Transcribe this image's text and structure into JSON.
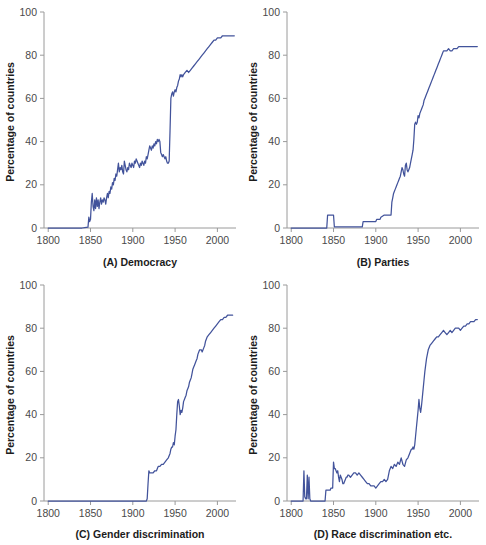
{
  "figure": {
    "axis_color": "#9a9a9a",
    "series_color": "#42539b",
    "text_color": "#1c1c1c",
    "tick_text_color": "#4a4a4a",
    "shared_ylabel": "Percentage of countries",
    "xticks": [
      1800,
      1850,
      1900,
      1950,
      2000
    ],
    "xtick_labels": [
      "1800",
      "1850",
      "1900",
      "1950",
      "2000"
    ],
    "yticks": [
      0,
      20,
      40,
      60,
      80,
      100
    ],
    "ytick_labels": [
      "0",
      "20",
      "40",
      "60",
      "80",
      "100"
    ],
    "xlim": [
      1795,
      2022
    ],
    "ylim": [
      0,
      100
    ]
  },
  "chart_data": [
    {
      "type": "line",
      "panel": "A",
      "title": "(A) Democracy",
      "xlabel": "",
      "ylabel": "Percentage of countries",
      "xlim": [
        1795,
        2022
      ],
      "ylim": [
        0,
        100
      ],
      "xticks": [
        1800,
        1850,
        1900,
        1950,
        2000
      ],
      "yticks": [
        0,
        20,
        40,
        60,
        80,
        100
      ],
      "grid": false,
      "legend": "none",
      "series": [
        {
          "name": "Democracy",
          "color": "#42539b",
          "x": [
            1800,
            1810,
            1820,
            1830,
            1840,
            1845,
            1847,
            1848,
            1849,
            1850,
            1851,
            1852,
            1853,
            1854,
            1855,
            1856,
            1857,
            1858,
            1859,
            1860,
            1861,
            1862,
            1863,
            1864,
            1865,
            1866,
            1867,
            1868,
            1869,
            1870,
            1871,
            1872,
            1873,
            1874,
            1875,
            1876,
            1877,
            1878,
            1879,
            1880,
            1881,
            1882,
            1883,
            1884,
            1885,
            1886,
            1887,
            1888,
            1889,
            1890,
            1891,
            1892,
            1893,
            1894,
            1895,
            1896,
            1897,
            1898,
            1899,
            1900,
            1901,
            1902,
            1903,
            1904,
            1905,
            1906,
            1907,
            1908,
            1909,
            1910,
            1911,
            1912,
            1913,
            1914,
            1915,
            1916,
            1917,
            1918,
            1919,
            1920,
            1921,
            1922,
            1923,
            1924,
            1925,
            1926,
            1927,
            1928,
            1929,
            1930,
            1931,
            1932,
            1933,
            1934,
            1935,
            1936,
            1937,
            1938,
            1939,
            1940,
            1941,
            1942,
            1943,
            1944,
            1945,
            1946,
            1947,
            1948,
            1949,
            1950,
            1951,
            1952,
            1953,
            1954,
            1955,
            1956,
            1957,
            1958,
            1959,
            1960,
            1962,
            1964,
            1966,
            1968,
            1970,
            1972,
            1974,
            1976,
            1978,
            1980,
            1982,
            1984,
            1986,
            1988,
            1990,
            1992,
            1994,
            1996,
            1998,
            2000,
            2002,
            2004,
            2006,
            2008,
            2010,
            2012,
            2014,
            2016,
            2018,
            2020
          ],
          "y": [
            0,
            0,
            0,
            0,
            0,
            0.3,
            0.4,
            5,
            3,
            4,
            12,
            16,
            10,
            8,
            13,
            9,
            14,
            10,
            13,
            9,
            12,
            14,
            11,
            13,
            12,
            14,
            13,
            11,
            14,
            16,
            14,
            17,
            16,
            19,
            18,
            21,
            20,
            23,
            22,
            25,
            24,
            27,
            30,
            26,
            28,
            27,
            29,
            26,
            25,
            31,
            29,
            27,
            26,
            28,
            27,
            30,
            29,
            28,
            30,
            29,
            28,
            31,
            30,
            32,
            31,
            30,
            29,
            28,
            30,
            29,
            31,
            30,
            29,
            31,
            30,
            33,
            32,
            34,
            36,
            38,
            37,
            36,
            38,
            37,
            39,
            38,
            40,
            39,
            41,
            40,
            41,
            40,
            35,
            34,
            33,
            34,
            33,
            32,
            33,
            31,
            30,
            30,
            31,
            45,
            60,
            62,
            63,
            61,
            63,
            64,
            63,
            65,
            66,
            68,
            69,
            71,
            70,
            71,
            70,
            71,
            72,
            73,
            72,
            73,
            74,
            75,
            76,
            77,
            78,
            79,
            80,
            81,
            82,
            83,
            84,
            85,
            86,
            87,
            87,
            88,
            88,
            88,
            89,
            89,
            89,
            89,
            89,
            89,
            89,
            89
          ]
        }
      ]
    },
    {
      "type": "line",
      "panel": "B",
      "title": "(B) Parties",
      "xlabel": "",
      "ylabel": "Percentage of countries",
      "xlim": [
        1795,
        2022
      ],
      "ylim": [
        0,
        100
      ],
      "xticks": [
        1800,
        1850,
        1900,
        1950,
        2000
      ],
      "yticks": [
        0,
        20,
        40,
        60,
        80,
        100
      ],
      "grid": false,
      "legend": "none",
      "series": [
        {
          "name": "Parties",
          "color": "#42539b",
          "x": [
            1800,
            1820,
            1835,
            1842,
            1843,
            1844,
            1848,
            1849,
            1850,
            1851,
            1852,
            1860,
            1870,
            1880,
            1884,
            1885,
            1890,
            1894,
            1895,
            1900,
            1901,
            1905,
            1906,
            1910,
            1911,
            1913,
            1914,
            1918,
            1919,
            1920,
            1921,
            1922,
            1923,
            1924,
            1925,
            1926,
            1927,
            1928,
            1929,
            1930,
            1931,
            1932,
            1933,
            1934,
            1935,
            1936,
            1937,
            1938,
            1939,
            1940,
            1941,
            1942,
            1943,
            1944,
            1945,
            1946,
            1947,
            1948,
            1949,
            1950,
            1951,
            1952,
            1953,
            1954,
            1955,
            1956,
            1957,
            1958,
            1959,
            1960,
            1961,
            1962,
            1963,
            1964,
            1965,
            1966,
            1967,
            1968,
            1969,
            1970,
            1971,
            1972,
            1973,
            1974,
            1975,
            1976,
            1977,
            1978,
            1979,
            1980,
            1982,
            1984,
            1986,
            1988,
            1990,
            1992,
            1994,
            1996,
            1998,
            2000,
            2005,
            2010,
            2015,
            2020
          ],
          "y": [
            0,
            0,
            0,
            0,
            6,
            6,
            6,
            6,
            6,
            0.5,
            0.5,
            0.5,
            0.5,
            0.5,
            0.5,
            3,
            3,
            3,
            3,
            3,
            4,
            4,
            5,
            6,
            6,
            6,
            6,
            6,
            12,
            14,
            16,
            17,
            18,
            19,
            20,
            21,
            22,
            23,
            24,
            26,
            28,
            27,
            25,
            24,
            29,
            30,
            27,
            26,
            27,
            28,
            30,
            32,
            34,
            36,
            41,
            48,
            49,
            48,
            49,
            52,
            51,
            53,
            54,
            55,
            56,
            57,
            59,
            60,
            61,
            62,
            63,
            64,
            65,
            66,
            67,
            68,
            69,
            70,
            71,
            72,
            73,
            74,
            75,
            76,
            77,
            78,
            79,
            80,
            81,
            82,
            82,
            82,
            83,
            82,
            82,
            83,
            83,
            83,
            84,
            84,
            84,
            84,
            84,
            84
          ]
        }
      ]
    },
    {
      "type": "line",
      "panel": "C",
      "title": "(C) Gender discrimination",
      "xlabel": "",
      "ylabel": "Percentage of countries",
      "xlim": [
        1795,
        2022
      ],
      "ylim": [
        0,
        100
      ],
      "xticks": [
        1800,
        1850,
        1900,
        1950,
        2000
      ],
      "yticks": [
        0,
        20,
        40,
        60,
        80,
        100
      ],
      "grid": false,
      "legend": "none",
      "series": [
        {
          "name": "Gender discrimination",
          "color": "#42539b",
          "x": [
            1800,
            1850,
            1900,
            1910,
            1915,
            1916,
            1917,
            1918,
            1919,
            1920,
            1922,
            1924,
            1926,
            1928,
            1930,
            1932,
            1934,
            1936,
            1938,
            1940,
            1942,
            1944,
            1945,
            1946,
            1947,
            1948,
            1949,
            1950,
            1951,
            1952,
            1953,
            1954,
            1955,
            1956,
            1957,
            1958,
            1959,
            1960,
            1961,
            1962,
            1963,
            1964,
            1965,
            1966,
            1967,
            1968,
            1969,
            1970,
            1971,
            1972,
            1973,
            1974,
            1975,
            1976,
            1977,
            1978,
            1979,
            1980,
            1981,
            1982,
            1983,
            1984,
            1985,
            1986,
            1988,
            1990,
            1992,
            1994,
            1996,
            1998,
            2000,
            2002,
            2004,
            2006,
            2008,
            2010,
            2012,
            2014,
            2016,
            2018
          ],
          "y": [
            0,
            0,
            0,
            0,
            0,
            0,
            1,
            8,
            14,
            13,
            13,
            13,
            14,
            14,
            16,
            16,
            17,
            17,
            18,
            19,
            20,
            22,
            24,
            25,
            25,
            27,
            26,
            30,
            33,
            40,
            46,
            47,
            44,
            40,
            42,
            41,
            43,
            46,
            47,
            48,
            49,
            51,
            52,
            53,
            55,
            56,
            57,
            59,
            61,
            62,
            63,
            64,
            65,
            66,
            68,
            69,
            70,
            70,
            70,
            69,
            70,
            71,
            72,
            74,
            76,
            77,
            78,
            79,
            80,
            81,
            82,
            83,
            84,
            84,
            85,
            85,
            86,
            86,
            86,
            86
          ]
        }
      ]
    },
    {
      "type": "line",
      "panel": "D",
      "title": "(D) Race discrimination etc.",
      "xlabel": "",
      "ylabel": "Percentage of countries",
      "xlim": [
        1795,
        2022
      ],
      "ylim": [
        0,
        100
      ],
      "xticks": [
        1800,
        1850,
        1900,
        1950,
        2000
      ],
      "yticks": [
        0,
        20,
        40,
        60,
        80,
        100
      ],
      "grid": false,
      "legend": "none",
      "series": [
        {
          "name": "Race discrimination etc.",
          "color": "#42539b",
          "x": [
            1800,
            1810,
            1814,
            1815,
            1816,
            1817,
            1818,
            1819,
            1820,
            1821,
            1822,
            1823,
            1825,
            1830,
            1835,
            1840,
            1841,
            1842,
            1843,
            1844,
            1845,
            1846,
            1847,
            1848,
            1849,
            1850,
            1851,
            1852,
            1853,
            1854,
            1855,
            1856,
            1857,
            1858,
            1859,
            1860,
            1861,
            1862,
            1863,
            1864,
            1865,
            1866,
            1867,
            1868,
            1870,
            1872,
            1874,
            1876,
            1878,
            1880,
            1882,
            1884,
            1886,
            1888,
            1890,
            1892,
            1894,
            1896,
            1898,
            1900,
            1902,
            1904,
            1906,
            1908,
            1910,
            1912,
            1914,
            1916,
            1918,
            1920,
            1922,
            1924,
            1926,
            1928,
            1930,
            1932,
            1934,
            1936,
            1938,
            1940,
            1941,
            1942,
            1943,
            1944,
            1945,
            1946,
            1947,
            1948,
            1949,
            1950,
            1951,
            1952,
            1953,
            1954,
            1955,
            1956,
            1957,
            1958,
            1959,
            1960,
            1962,
            1964,
            1966,
            1968,
            1970,
            1972,
            1974,
            1976,
            1978,
            1980,
            1982,
            1984,
            1986,
            1988,
            1990,
            1992,
            1994,
            1996,
            1998,
            2000,
            2002,
            2004,
            2006,
            2008,
            2010,
            2012,
            2014,
            2016,
            2018,
            2020
          ],
          "y": [
            0,
            0,
            0,
            14,
            2,
            1,
            1,
            12,
            1,
            11,
            1,
            0,
            0,
            0,
            0,
            0,
            5,
            5,
            5,
            5,
            5,
            5,
            6,
            6,
            6,
            18,
            15,
            15,
            14,
            13,
            14,
            11,
            9,
            12,
            11,
            10,
            8,
            8,
            9,
            10,
            11,
            11,
            12,
            12,
            11,
            12,
            13,
            13,
            12,
            13,
            12,
            11,
            10,
            9,
            8,
            8,
            7,
            7,
            7,
            6,
            7,
            8,
            9,
            9,
            10,
            9,
            10,
            14,
            16,
            15,
            17,
            16,
            18,
            17,
            20,
            17,
            16,
            19,
            20,
            22,
            23,
            24,
            24,
            25,
            24,
            26,
            30,
            34,
            38,
            42,
            47,
            43,
            41,
            44,
            48,
            52,
            56,
            60,
            63,
            66,
            70,
            72,
            73,
            74,
            75,
            76,
            76,
            77,
            78,
            79,
            78,
            77,
            78,
            79,
            78,
            79,
            80,
            80,
            80,
            79,
            80,
            81,
            81,
            82,
            82,
            83,
            83,
            83,
            84,
            84
          ]
        }
      ]
    }
  ]
}
